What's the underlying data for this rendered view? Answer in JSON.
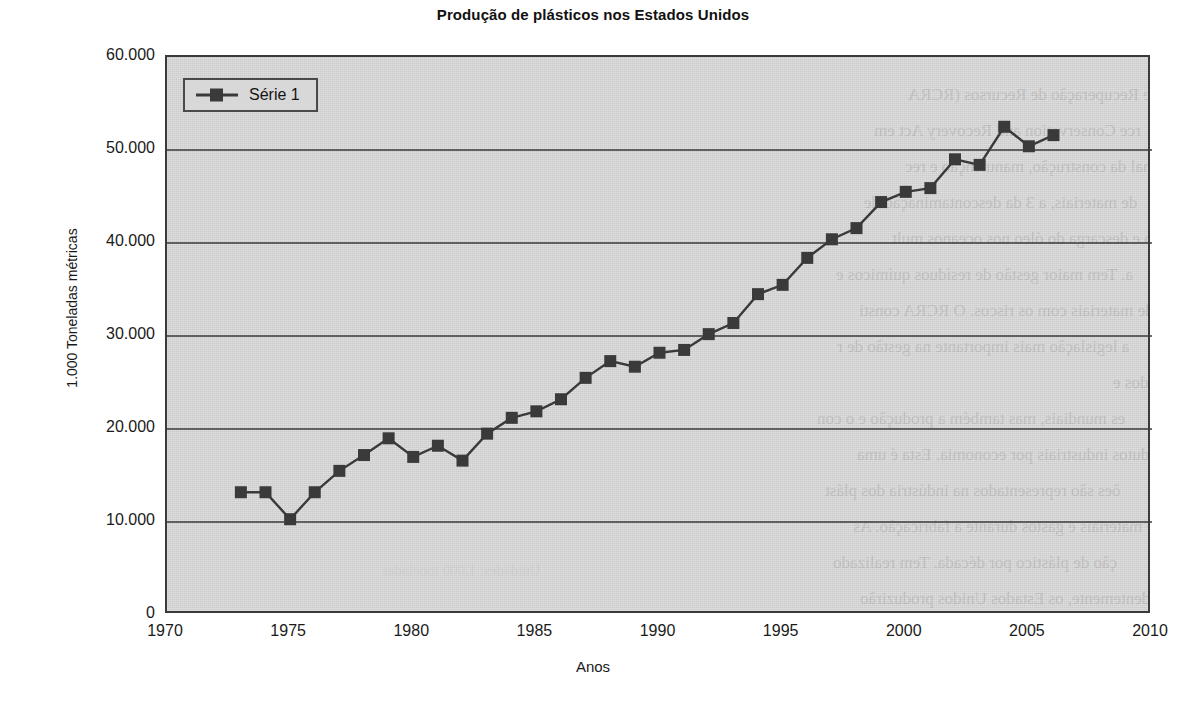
{
  "chart_data": {
    "type": "line",
    "title": "Produção de plásticos nos Estados Unidos",
    "xlabel": "Anos",
    "ylabel": "1.000 Toneladas métricas",
    "xlim": [
      1970,
      2010
    ],
    "ylim": [
      0,
      60000
    ],
    "xticks": [
      "1970",
      "1975",
      "1980",
      "1985",
      "1990",
      "1995",
      "2000",
      "2005",
      "2010"
    ],
    "xtick_values": [
      1970,
      1975,
      1980,
      1985,
      1990,
      1995,
      2000,
      2005,
      2010
    ],
    "yticks": [
      "0",
      "10.000",
      "20.000",
      "30.000",
      "40.000",
      "50.000",
      "60.000"
    ],
    "ytick_values": [
      0,
      10000,
      20000,
      30000,
      40000,
      50000,
      60000
    ],
    "grid": "horizontal",
    "legend_position": "top-left",
    "marker": "square",
    "series": [
      {
        "name": "Série 1",
        "color": "#3a3a3a",
        "x": [
          1973,
          1974,
          1975,
          1976,
          1977,
          1978,
          1979,
          1980,
          1981,
          1982,
          1983,
          1984,
          1985,
          1986,
          1987,
          1988,
          1989,
          1990,
          1991,
          1992,
          1993,
          1994,
          1995,
          1996,
          1997,
          1998,
          1999,
          2000,
          2001,
          2002,
          2003,
          2004,
          2005,
          2006
        ],
        "values": [
          13200,
          13200,
          10300,
          13200,
          15500,
          17200,
          19000,
          17000,
          18200,
          16600,
          19500,
          21200,
          21900,
          23200,
          25500,
          27300,
          26700,
          28200,
          28500,
          30200,
          31400,
          34500,
          35500,
          38400,
          40400,
          41600,
          44400,
          45500,
          45900,
          49000,
          48400,
          52500,
          50400,
          51600
        ]
      }
    ]
  },
  "legend": {
    "entries": [
      {
        "label": "Série 1"
      }
    ]
  },
  "ghost_text": {
    "lines": [
      "ção e Recuperação de Recursos (RCRA",
      "rce Conservation and Recovery Act em",
      "a final da construção, manutenção e rec",
      "de materiais, a 3 da descontaminação de",
      "ubo e descarga do óleo nos oceanos mult",
      "a. Tem maior gestão de resíduos químicos e",
      "o de materiais com os riscos. O RCRA consti",
      "a  legislação mais importante na gestão de r",
      "nidos e",
      "es mundiais, mas também a produção e o con",
      "odutos industriais por  economia. Esta é uma",
      "ões são representados na indústria dos plást",
      "e materiais e gastos durante a fabricação. As",
      "ção de plástico por década. Tem realizado",
      "dentemente, os Estados Unidos produzirão"
    ],
    "unit_note": "Unidades: 1.000 toneladas"
  }
}
